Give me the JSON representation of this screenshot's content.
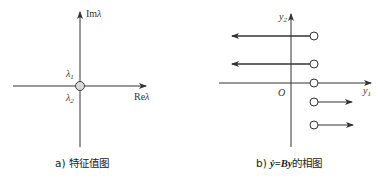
{
  "panel_a": {
    "y_axis_label_prefix": "Im",
    "y_axis_label_symbol": "λ",
    "x_axis_label_prefix": "Re",
    "x_axis_label_symbol": "λ",
    "eigen_top": "λ",
    "eigen_top_sub": "1",
    "eigen_bottom": "λ",
    "eigen_bottom_sub": "2",
    "caption": "a) 特征值图"
  },
  "panel_b": {
    "y_axis_label": "y",
    "y_axis_sub": "2",
    "x_axis_label": "y",
    "x_axis_sub": "1",
    "origin_label": "O",
    "caption_prefix": "b) ",
    "caption_ydot": "ẏ",
    "caption_eq": "=",
    "caption_By": "By",
    "caption_suffix": "的相图"
  },
  "colors": {
    "line": "#333333",
    "circle_fill_a": "#d8d8d8",
    "circle_fill_b": "#ffffff"
  }
}
